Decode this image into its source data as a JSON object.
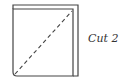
{
  "diagram": {
    "type": "folded-paper-cut-step",
    "label": "Cut 2",
    "colors": {
      "stroke": "#444444",
      "background": "#ffffff",
      "text": "#333333"
    },
    "shapes": {
      "back_sheet": "square offset to the right/top",
      "front_sheet": "square with rounded bottom-left corner",
      "cut_line": "dashed diagonal from bottom-left to top-right"
    }
  }
}
